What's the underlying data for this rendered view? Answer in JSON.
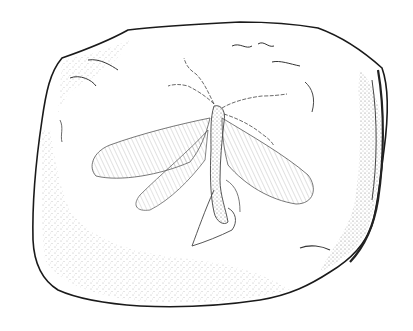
{
  "image": {
    "subject": "fossil-insect-illustration",
    "style": "pen-and-ink stipple drawing",
    "colors": {
      "background": "#ffffff",
      "ink": "#1a1a1a",
      "stipple": "#555555"
    }
  }
}
